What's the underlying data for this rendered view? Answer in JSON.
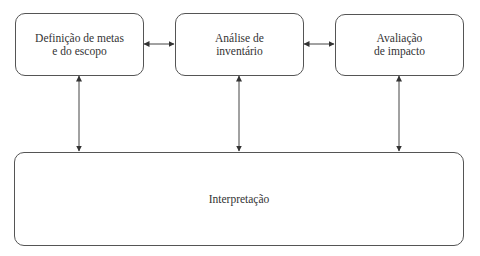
{
  "diagram": {
    "nodes": [
      {
        "id": "goal",
        "label": "Definição de metas\ne do escopo"
      },
      {
        "id": "inventory",
        "label": "Análise de\ninventário"
      },
      {
        "id": "impact",
        "label": "Avaliação\nde impacto"
      },
      {
        "id": "interpretation",
        "label": "Interpretação"
      }
    ],
    "edges": [
      {
        "from": "goal",
        "to": "inventory",
        "type": "bidirectional"
      },
      {
        "from": "inventory",
        "to": "impact",
        "type": "bidirectional"
      },
      {
        "from": "goal",
        "to": "interpretation",
        "type": "bidirectional"
      },
      {
        "from": "inventory",
        "to": "interpretation",
        "type": "bidirectional"
      },
      {
        "from": "impact",
        "to": "interpretation",
        "type": "bidirectional"
      }
    ]
  }
}
